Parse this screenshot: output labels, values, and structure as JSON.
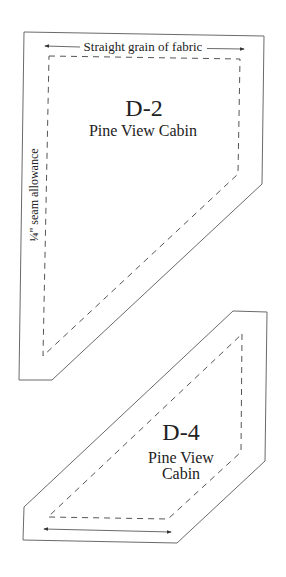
{
  "pieces": [
    {
      "id": "D-2",
      "label": "D-2",
      "name": "Pine View Cabin",
      "grain_label": "Straight grain of fabric",
      "seam_label": "¼\" seam allowance"
    },
    {
      "id": "D-4",
      "label": "D-4",
      "name_line1": "Pine View",
      "name_line2": "Cabin"
    }
  ],
  "colors": {
    "outline": "#6a6a6a",
    "seam": "#555555",
    "text": "#222222",
    "background": "#ffffff"
  }
}
